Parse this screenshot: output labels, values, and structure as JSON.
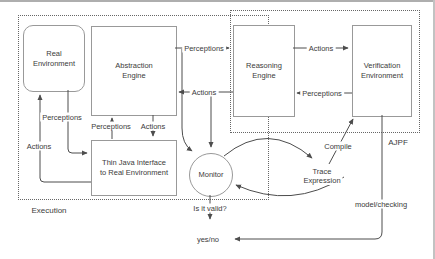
{
  "regions": {
    "execution": {
      "label": "Execution"
    },
    "ajpf": {
      "label": "AJPF"
    }
  },
  "nodes": {
    "real_environment": {
      "line1": "Real",
      "line2": "Environment"
    },
    "abstraction_engine": {
      "line1": "Abstraction",
      "line2": "Engine"
    },
    "thin_java_interface": {
      "line1": "Thin Java Interface",
      "line2": "to Real Environment"
    },
    "reasoning_engine": {
      "line1": "Reasoning",
      "line2": "Engine"
    },
    "verification_environment": {
      "line1": "Verification",
      "line2": "Environment"
    },
    "monitor": {
      "label": "Monitor"
    },
    "trace_expression": {
      "line1": "Trace",
      "line2": "Expression"
    }
  },
  "edge_labels": {
    "ae_to_re": "Perceptions",
    "re_to_ae": "Actions",
    "re_to_ve": "Actions",
    "ve_to_re": "Perceptions",
    "renv_to_tji": "Perceptions",
    "tji_to_renv": "Actions",
    "tji_to_ae": "Perceptions",
    "ae_to_tji": "Actions",
    "compile": "Compile",
    "model_checking": "model/checking",
    "monitor_question": "Is it valid?",
    "result": "yes/no"
  },
  "colors": {
    "background": "#ffffff",
    "box_border": "#999999",
    "arrow_line": "#4d4d4d",
    "dashed_border": "#666666",
    "text": "#3b3b3b"
  }
}
